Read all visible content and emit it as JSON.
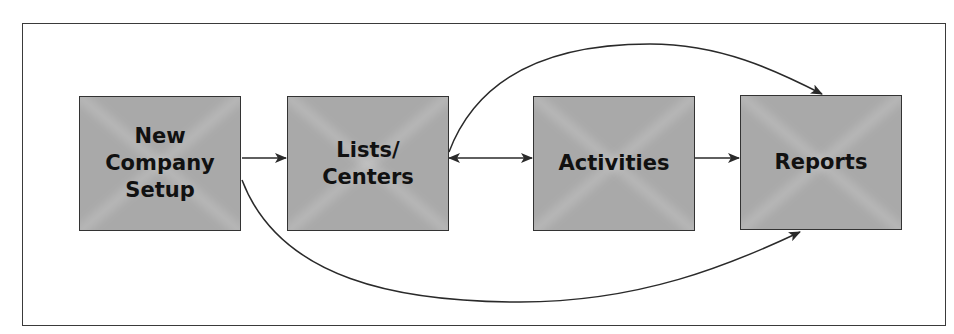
{
  "diagram": {
    "nodes": [
      {
        "id": "new-company-setup",
        "label": "New\nCompany\nSetup"
      },
      {
        "id": "lists-centers",
        "label": "Lists/\nCenters"
      },
      {
        "id": "activities",
        "label": "Activities"
      },
      {
        "id": "reports",
        "label": "Reports"
      }
    ],
    "edges": [
      {
        "from": "new-company-setup",
        "to": "lists-centers",
        "direction": "forward"
      },
      {
        "from": "lists-centers",
        "to": "activities",
        "direction": "bidirectional"
      },
      {
        "from": "activities",
        "to": "reports",
        "direction": "forward"
      },
      {
        "from": "lists-centers",
        "to": "reports",
        "direction": "forward",
        "route": "curved-above"
      },
      {
        "from": "new-company-setup",
        "to": "reports",
        "direction": "forward",
        "route": "curved-below"
      }
    ],
    "colors": {
      "box_fill": "#a9a9a9",
      "stroke": "#333333",
      "text": "#111111"
    }
  }
}
